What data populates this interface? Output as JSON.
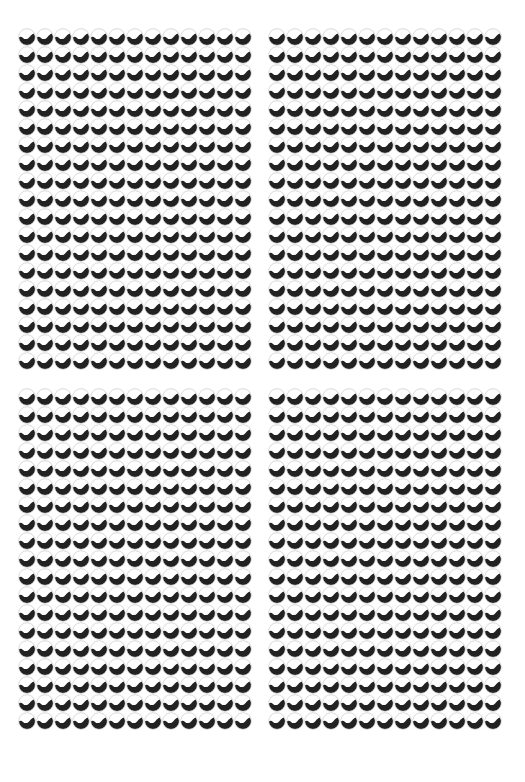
{
  "pattern": {
    "description": "Optical illusion grid of wave-split circles",
    "icon": "wave-split-circle",
    "colors": {
      "background": "#ffffff",
      "dark_fill": "#222222",
      "light_fill": "#ffffff",
      "outline": "#c8c8c8"
    },
    "cell_size_px": 18,
    "panels": [
      {
        "id": "top-left",
        "x": 18,
        "y": 28,
        "columns": 13,
        "rows": 19
      },
      {
        "id": "top-right",
        "x": 268,
        "y": 28,
        "columns": 13,
        "rows": 19
      },
      {
        "id": "bottom-left",
        "x": 18,
        "y": 388,
        "columns": 13,
        "rows": 19
      },
      {
        "id": "bottom-right",
        "x": 268,
        "y": 388,
        "columns": 13,
        "rows": 19
      }
    ]
  }
}
